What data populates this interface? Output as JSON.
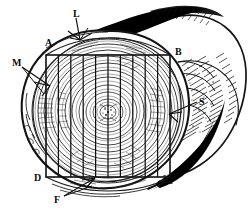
{
  "figure": {
    "background_color": "#ffffff",
    "ink_color": "#111111",
    "ring_color": "#2a2a2a",
    "shadow_color": "#000000"
  },
  "labels": [
    {
      "id": "L",
      "text": "L",
      "name": "label-l",
      "x": 73,
      "y": 9,
      "meaning": "log top edge callout"
    },
    {
      "id": "A",
      "text": "A",
      "name": "label-a",
      "x": 45,
      "y": 38,
      "meaning": "cant corner A (upper left)"
    },
    {
      "id": "B",
      "text": "B",
      "name": "label-b",
      "x": 175,
      "y": 47,
      "meaning": "cant corner B (upper right)"
    },
    {
      "id": "M",
      "text": "M",
      "name": "label-m",
      "x": 12,
      "y": 58,
      "meaning": "slab / outer wood callout"
    },
    {
      "id": "S",
      "text": "S",
      "name": "label-s",
      "x": 199,
      "y": 97,
      "meaning": "sapwood / bark callout"
    },
    {
      "id": "D",
      "text": "D",
      "name": "label-d",
      "x": 34,
      "y": 173,
      "meaning": "cant corner D (lower left)"
    },
    {
      "id": "C",
      "text": "C",
      "name": "label-c",
      "x": 166,
      "y": 176,
      "meaning": "cant corner C (lower right)"
    },
    {
      "id": "F",
      "text": "F",
      "name": "label-f",
      "x": 54,
      "y": 195,
      "meaning": "bottom slab face callout"
    }
  ],
  "geometry": {
    "cant": {
      "top_y": 55,
      "bottom_y": 177,
      "left_x": 46,
      "right_x": 170,
      "board_count": 10,
      "vertical_line_xs": [
        46,
        58.4,
        70.8,
        83.2,
        95.6,
        108,
        120.4,
        132.8,
        145.2,
        157.6,
        170
      ]
    },
    "pith": {
      "x": 108,
      "y": 112
    },
    "growth_rings": [
      8,
      15,
      22,
      29,
      36,
      43,
      50,
      57,
      64,
      70,
      76
    ],
    "bark_outline_rx": 76,
    "bark_outline_ry": 76
  },
  "leaders": [
    {
      "name": "leader-l",
      "from": [
        76,
        17
      ],
      "to": [
        83,
        38
      ],
      "style": "double-barb"
    },
    {
      "name": "leader-m",
      "from": [
        21,
        66
      ],
      "to": [
        48,
        84
      ],
      "style": "double-barb"
    },
    {
      "name": "leader-s",
      "from": [
        198,
        101
      ],
      "to": [
        170,
        113
      ],
      "style": "single-barb"
    },
    {
      "name": "leader-f",
      "from": [
        64,
        196
      ],
      "to": [
        93,
        179
      ],
      "style": "double-barb"
    }
  ]
}
